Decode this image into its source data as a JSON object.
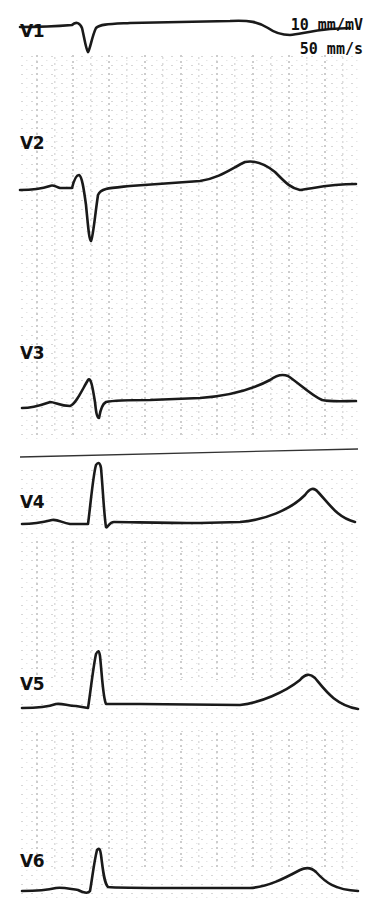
{
  "calibration": {
    "gain": "10 mm/mV",
    "speed": "50 mm/s"
  },
  "colors": {
    "trace": "#1a1a1a",
    "grid_dot": "#9a9a9a",
    "background": "#ffffff"
  },
  "separator_line": {
    "y_start": 457,
    "y_end": 449
  },
  "leads": [
    {
      "name": "V1",
      "label_x": 20,
      "label_y": 38,
      "path": "M 20 27 C 40 27, 60 26, 72 25 C 76 21, 80 23, 82 28 C 84 36, 86 50, 88 52 C 90 50, 92 36, 96 28 C 100 24, 110 24, 130 23 L 230 21 C 250 20, 258 22, 268 28 C 275 33, 282 35, 290 35 C 300 34, 310 31, 330 29 L 350 28"
    },
    {
      "name": "V2",
      "label_x": 20,
      "label_y": 150,
      "path": "M 20 190 C 35 190, 44 188, 50 186 C 53 184, 56 187, 60 188 L 72 188 C 74 180, 76 175, 79 175 C 82 176, 84 190, 86 205 C 88 225, 89 240, 91 241 C 93 238, 95 215, 98 195 C 101 188, 110 188, 130 186 L 200 181 C 220 178, 232 168, 245 162 C 255 160, 265 164, 275 172 C 285 182, 290 188, 300 190 C 315 188, 330 184, 356 184"
    },
    {
      "name": "V3",
      "label_x": 20,
      "label_y": 360,
      "path": "M 22 408 C 35 408, 44 404, 50 402 C 55 402, 60 406, 70 406 C 76 404, 82 390, 88 380 C 91 376, 93 390, 95 402 C 96 412, 97 418, 99 418 C 100 412, 102 404, 106 402 C 115 400, 130 400, 150 400 L 200 398 C 230 396, 255 388, 270 380 C 278 374, 283 374, 288 376 C 300 384, 312 396, 322 400 C 330 402, 345 401, 356 401"
    },
    {
      "name": "V4",
      "label_x": 20,
      "label_y": 509,
      "path": "M 22 524 C 35 524, 44 522, 52 520 C 58 519, 62 523, 70 524 L 88 524 C 90 510, 93 475, 96 465 C 98 462, 100 462, 101 468 C 103 490, 104 515, 106 527 C 107 529, 109 522, 114 522 C 130 522, 160 523, 200 523 L 240 522 C 265 520, 290 510, 305 495 C 310 488, 314 487, 318 492 C 330 505, 338 518, 355 522"
    },
    {
      "name": "V5",
      "label_x": 20,
      "label_y": 691,
      "path": "M 22 708 C 35 708, 48 707, 56 704 C 62 703, 68 706, 76 706 L 88 708 C 90 696, 93 668, 96 654 C 98 650, 99 650, 100 656 C 102 675, 103 698, 106 704 C 110 704, 120 704, 140 704 L 240 705 C 260 703, 285 692, 300 680 C 305 674, 310 673, 315 678 C 325 690, 335 705, 358 709"
    },
    {
      "name": "V6",
      "label_x": 20,
      "label_y": 868,
      "path": "M 22 891 C 35 891, 48 890, 56 888 C 63 887, 70 889, 78 890 C 84 893, 88 894, 90 891 C 92 880, 94 862, 97 850 C 99 848, 100 848, 101 855 C 103 870, 104 883, 108 887 C 115 888, 140 888, 180 888 L 250 888 C 268 887, 285 878, 300 870 C 306 867, 311 867, 316 872 C 325 882, 335 890, 358 891"
    }
  ]
}
